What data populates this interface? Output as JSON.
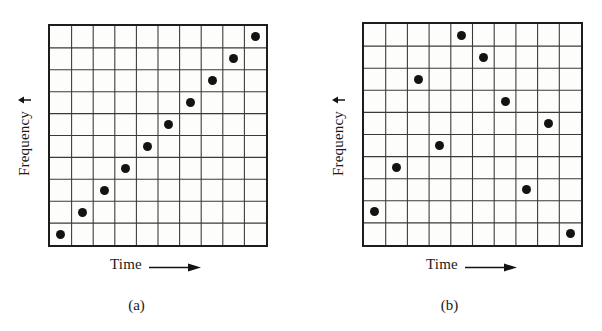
{
  "figure": {
    "background_color": "#ffffff",
    "ink_color": "#131313",
    "grid_line_color": "#3a3a3a",
    "plot_fill_color": "#fdfdfb"
  },
  "panels": [
    {
      "id": "a",
      "caption": "(a)",
      "x_axis_label": "Time",
      "x_axis_arrow": "arrow-right-icon",
      "y_axis_label": "Frequency",
      "y_axis_arrow": "arrow-up-icon",
      "grid_columns": 10,
      "grid_rows": 10,
      "chart_data": {
        "type": "scatter",
        "title": "(a)",
        "xlabel": "Time",
        "ylabel": "Frequency",
        "xlim": [
          0,
          10
        ],
        "ylim": [
          0,
          10
        ],
        "grid": true,
        "description": "Linear ascending chirp: one marker per time slot, frequency increases monotonically one cell per step.",
        "x": [
          0,
          1,
          2,
          3,
          4,
          5,
          6,
          7,
          8,
          9
        ],
        "y": [
          0,
          1,
          2,
          3,
          4,
          5,
          6,
          7,
          8,
          9
        ],
        "points": [
          {
            "col": 0,
            "row_from_top": 9,
            "freq_index": 0
          },
          {
            "col": 1,
            "row_from_top": 8,
            "freq_index": 1
          },
          {
            "col": 2,
            "row_from_top": 7,
            "freq_index": 2
          },
          {
            "col": 3,
            "row_from_top": 6,
            "freq_index": 3
          },
          {
            "col": 4,
            "row_from_top": 5,
            "freq_index": 4
          },
          {
            "col": 5,
            "row_from_top": 4,
            "freq_index": 5
          },
          {
            "col": 6,
            "row_from_top": 3,
            "freq_index": 6
          },
          {
            "col": 7,
            "row_from_top": 2,
            "freq_index": 7
          },
          {
            "col": 8,
            "row_from_top": 1,
            "freq_index": 8
          },
          {
            "col": 9,
            "row_from_top": 0,
            "freq_index": 9
          }
        ]
      }
    },
    {
      "id": "b",
      "caption": "(b)",
      "x_axis_label": "Time",
      "x_axis_arrow": "arrow-right-icon",
      "y_axis_label": "Frequency",
      "y_axis_arrow": "arrow-up-icon",
      "grid_columns": 10,
      "grid_rows": 10,
      "chart_data": {
        "type": "scatter",
        "title": "(b)",
        "xlabel": "Time",
        "ylabel": "Frequency",
        "xlim": [
          0,
          10
        ],
        "ylim": [
          0,
          10
        ],
        "grid": true,
        "description": "Pseudo-random frequency-hopping pattern: one marker per time slot, frequency chosen pseudo-randomly.",
        "x": [
          0,
          1,
          2,
          3,
          4,
          5,
          6,
          7,
          8,
          9
        ],
        "y": [
          1,
          3,
          7,
          4,
          9,
          8,
          6,
          2,
          5,
          0
        ],
        "points": [
          {
            "col": 0,
            "row_from_top": 8,
            "freq_index": 1
          },
          {
            "col": 1,
            "row_from_top": 6,
            "freq_index": 3
          },
          {
            "col": 2,
            "row_from_top": 2,
            "freq_index": 7
          },
          {
            "col": 3,
            "row_from_top": 5,
            "freq_index": 4
          },
          {
            "col": 4,
            "row_from_top": 0,
            "freq_index": 9
          },
          {
            "col": 5,
            "row_from_top": 1,
            "freq_index": 8
          },
          {
            "col": 6,
            "row_from_top": 3,
            "freq_index": 6
          },
          {
            "col": 7,
            "row_from_top": 7,
            "freq_index": 2
          },
          {
            "col": 8,
            "row_from_top": 4,
            "freq_index": 5
          },
          {
            "col": 9,
            "row_from_top": 9,
            "freq_index": 0
          }
        ]
      }
    }
  ]
}
